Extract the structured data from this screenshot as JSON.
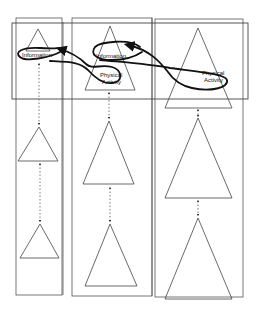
{
  "diagram": {
    "type": "three-column hierarchy with linked top nodes",
    "colors": {
      "line": "#555555",
      "path": "#1a1a1a",
      "background": "#ffffff"
    },
    "top_band": {
      "label": ""
    },
    "columns": [
      {
        "id": "col-1",
        "levels": 3,
        "top_label": "Information"
      },
      {
        "id": "col-2",
        "levels": 3,
        "top_labels": [
          "Information",
          "Physical",
          "Activity"
        ]
      },
      {
        "id": "col-3",
        "levels": 3,
        "top_labels": [
          "Physical",
          "Activity"
        ]
      }
    ],
    "labels": {
      "col1_info": "Information",
      "col2_info": "Information",
      "col2_pa_line1": "Physical",
      "col2_pa_line2": "Activity",
      "col3_pa_line1": "Physical",
      "col3_pa_line2": "Activity"
    },
    "connectors": "dotted double-headed arrows between stacked triangles",
    "flow_path": "thick looping arrow linking Information and Physical Activity nodes across columns"
  }
}
